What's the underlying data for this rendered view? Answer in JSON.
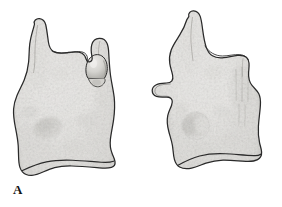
{
  "plate": {
    "figure_label": "A",
    "background_color": "#ffffff",
    "outline_color": "#2a2a2a",
    "label_color": "#141414",
    "medium": "grayscale pen-and-ink stipple illustration",
    "width": 282,
    "height": 207
  },
  "palette": {
    "paper": "#ffffff",
    "bone_light": "#f0efee",
    "bone_mid": "#dddcda",
    "bone_shade": "#c3c2bf",
    "bone_dark": "#a6a5a1",
    "fossa_dark": "#8d8c88",
    "outline": "#2a2a2a",
    "outline_soft": "#4a4a48"
  },
  "specimens": [
    {
      "id": "specimen-left",
      "view": "left",
      "name": "bone-specimen-left-view",
      "features": [
        {
          "name": "superior-left-process",
          "description": "tall rounded finger-like projection at upper left"
        },
        {
          "name": "superior-right-process",
          "description": "shorter rounded projection at upper right"
        },
        {
          "name": "median-knob-process",
          "description": "rounded condyle-like knob seated in the notch between processes"
        },
        {
          "name": "intervening-notch",
          "description": "curved notch separating the two superior processes"
        },
        {
          "name": "body-fossa",
          "description": "dark elongated depression on the left of the body"
        },
        {
          "name": "lateral-bulge",
          "description": "broad bulbous lower body with stippled texture"
        },
        {
          "name": "basal-flange",
          "description": "ridge-like flange extending along the lower margin"
        }
      ]
    },
    {
      "id": "specimen-right",
      "view": "right",
      "name": "bone-specimen-right-view",
      "features": [
        {
          "name": "superior-left-horn",
          "description": "tall horn-like projection at upper left"
        },
        {
          "name": "superior-right-horn",
          "description": "tall horn-like projection at upper right"
        },
        {
          "name": "interhorn-notch",
          "description": "wavy U-shaped notch between the two horns"
        },
        {
          "name": "lateral-wing-process",
          "description": "wing-like lateral projection on the left margin"
        },
        {
          "name": "central-foramen",
          "description": "prominent circular pit with crescent shadow in the lower body"
        },
        {
          "name": "striated-groove-field",
          "description": "dark vertical striations below the right horn"
        },
        {
          "name": "basal-foot",
          "description": "tapering foot-like flange at the base"
        }
      ]
    }
  ]
}
